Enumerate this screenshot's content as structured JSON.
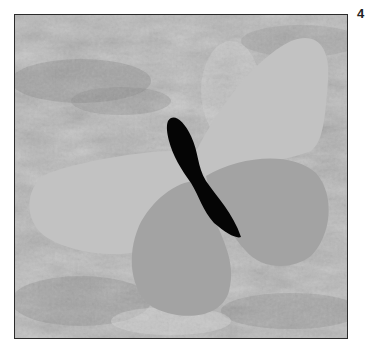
{
  "figure": {
    "label": "4",
    "colors": {
      "background": "#b4b4b4",
      "upper_wings": "#c2c2c2",
      "lower_wings": "#a3a3a3",
      "body": "#050505",
      "frame_border": "#2a2a2a"
    }
  }
}
